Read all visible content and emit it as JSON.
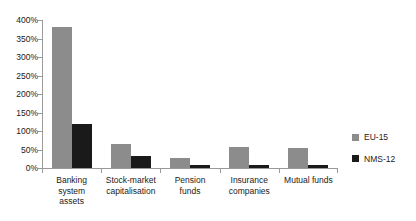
{
  "chart_data": {
    "type": "bar",
    "title": "",
    "subtitle": "",
    "xlabel": "",
    "ylabel": "",
    "ylim": [
      0,
      400
    ],
    "ytick_values": [
      0,
      50,
      100,
      150,
      200,
      250,
      300,
      350,
      400
    ],
    "ytick_labels": [
      "0%",
      "50%",
      "100%",
      "150%",
      "200%",
      "250%",
      "300%",
      "350%",
      "400%"
    ],
    "grid": false,
    "legend_position": "right",
    "categories": [
      "Banking system assets",
      "Stock-market capitalisation",
      "Pension funds",
      "Insurance companies",
      "Mutual funds"
    ],
    "category_labels": [
      [
        "Banking",
        "system",
        "assets"
      ],
      [
        "Stock-market",
        "capitalisation"
      ],
      [
        "Pension",
        "funds"
      ],
      [
        "Insurance",
        "companies"
      ],
      [
        "Mutual funds"
      ]
    ],
    "series": [
      {
        "name": "EU-15",
        "color": "#8c8c8c",
        "values": [
          380,
          65,
          27,
          57,
          54
        ]
      },
      {
        "name": "NMS-12",
        "color": "#1a1a1a",
        "values": [
          120,
          32,
          8,
          8,
          7
        ]
      }
    ]
  },
  "legend": {
    "items": [
      {
        "label": "EU-15",
        "color": "#8c8c8c"
      },
      {
        "label": "NMS-12",
        "color": "#1a1a1a"
      }
    ]
  },
  "colors": {
    "eu15": "#8c8c8c",
    "nms12": "#1a1a1a",
    "axis": "#9a9a9a",
    "background": "#ffffff",
    "text": "#1a1a1a"
  }
}
